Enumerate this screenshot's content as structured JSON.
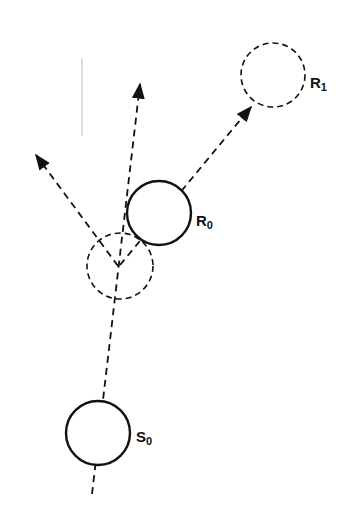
{
  "diagram": {
    "type": "collision-reflection-diagram",
    "colors": {
      "stroke": "#111111",
      "faint": "#bbbbbb",
      "background": "#ffffff"
    },
    "nodes": [
      {
        "id": "S0",
        "label": "S",
        "subscript": "0",
        "style": "solid"
      },
      {
        "id": "R0",
        "label": "R",
        "subscript": "0",
        "style": "solid"
      },
      {
        "id": "R1",
        "label": "R",
        "subscript": "1",
        "style": "dashed"
      },
      {
        "id": "collision-point",
        "label": "",
        "style": "dashed"
      }
    ],
    "edges": [
      {
        "from": "S0",
        "to": "up",
        "style": "dashed-arrow"
      },
      {
        "from": "collision-point",
        "to": "upper-left",
        "style": "dashed-arrow"
      },
      {
        "from": "collision-point",
        "to": "R1",
        "style": "dashed-arrow"
      }
    ]
  }
}
